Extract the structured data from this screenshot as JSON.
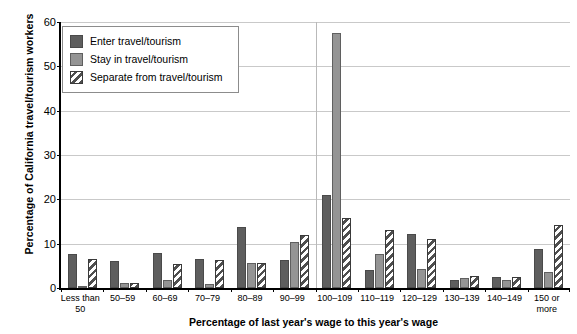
{
  "chart_data": {
    "type": "bar",
    "title": "",
    "xlabel": "Percentage of last year's wage to this year's wage",
    "ylabel": "Percentage of California travel/tourism workers",
    "ylim": [
      0,
      60
    ],
    "yticks": [
      0,
      10,
      20,
      30,
      40,
      50,
      60
    ],
    "grid": true,
    "legend_position": "upper-left-inside",
    "categories": [
      "Less than 50",
      "50–59",
      "60–69",
      "70–79",
      "80–89",
      "90–99",
      "100–109",
      "110–119",
      "120–129",
      "130–139",
      "140–149",
      "150 or more"
    ],
    "series": [
      {
        "name": "Enter travel/tourism",
        "style": "solid-dark-gray",
        "color": "#5e5e5e",
        "values": [
          7.6,
          6.1,
          8.0,
          6.5,
          13.7,
          6.3,
          21.0,
          4.0,
          12.2,
          1.8,
          2.4,
          8.7
        ]
      },
      {
        "name": "Stay in travel/tourism",
        "style": "solid-medium-gray",
        "color": "#949494",
        "values": [
          0.4,
          1.2,
          1.7,
          0.9,
          5.6,
          10.4,
          57.5,
          7.6,
          4.3,
          2.2,
          1.8,
          3.6
        ]
      },
      {
        "name": "Separate from travel/tourism",
        "style": "diagonal-hatch",
        "color": "#ffffff",
        "values": [
          6.6,
          1.2,
          5.5,
          6.4,
          5.6,
          12.0,
          15.8,
          13.0,
          11.0,
          2.6,
          2.4,
          14.3
        ]
      }
    ]
  },
  "legend": {
    "items": [
      {
        "label": "Enter travel/tourism",
        "swatch": "solid-dark-gray"
      },
      {
        "label": "Stay in travel/tourism",
        "swatch": "solid-medium-gray"
      },
      {
        "label": "Separate from travel/tourism",
        "swatch": "diagonal-hatch"
      }
    ]
  }
}
